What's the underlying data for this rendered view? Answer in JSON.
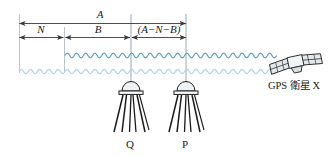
{
  "diagram": {
    "colors": {
      "line": "#3a3a3a",
      "extension_line": "#b9c6d0",
      "wave_primary": "#5b9dd0",
      "wave_secondary": "#aed4ea",
      "antenna_fill": "#e8eef2",
      "antenna_stroke": "#1a1a1a",
      "satellite_fill": "#e3e7ea",
      "satellite_stroke": "#2b2b2b",
      "text": "#1a1a1a"
    },
    "dimensions": {
      "total": {
        "label": "A",
        "name": "total-distance"
      },
      "segments": [
        {
          "label": "N",
          "paren": false,
          "name": "segment-n"
        },
        {
          "label": "B",
          "paren": false,
          "name": "segment-b"
        },
        {
          "label": "(A−N−B)",
          "paren": true,
          "name": "segment-a-minus-n-minus-b"
        }
      ]
    },
    "receivers": [
      {
        "label": "Q",
        "name": "receiver-q"
      },
      {
        "label": "P",
        "name": "receiver-p"
      }
    ],
    "satellite": {
      "label": "GPS 衛星 X",
      "name": "gps-satellite-x"
    }
  }
}
